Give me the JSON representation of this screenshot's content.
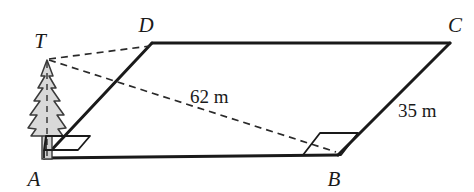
{
  "figure": {
    "type": "geometry-diagram",
    "colors": {
      "stroke": "#1a1a1a",
      "tree_fill": "#d9d9d9",
      "tree_outline": "#3a3a3a",
      "background": "#ffffff"
    },
    "vertices": [
      {
        "name": "A",
        "label": "A",
        "x": 44,
        "y": 158,
        "label_x": 34,
        "label_y": 186
      },
      {
        "name": "B",
        "label": "B",
        "x": 338,
        "y": 155,
        "label_x": 329,
        "label_y": 186
      },
      {
        "name": "C",
        "label": "C",
        "x": 450,
        "y": 43,
        "label_x": 449,
        "label_y": 30
      },
      {
        "name": "D",
        "label": "D",
        "x": 152,
        "y": 43,
        "label_x": 139,
        "label_y": 30
      },
      {
        "name": "T",
        "label": "T",
        "x": 47,
        "y": 58,
        "label_x": 35,
        "label_y": 48
      }
    ],
    "solid_edges": [
      {
        "name": "edge-A-B",
        "from": "A",
        "to": "B"
      },
      {
        "name": "edge-B-C",
        "from": "B",
        "to": "C"
      },
      {
        "name": "edge-C-D",
        "from": "C",
        "to": "D"
      },
      {
        "name": "edge-D-A",
        "from": "D",
        "to": "A"
      }
    ],
    "dashed_segments": [
      {
        "name": "segment-T-B",
        "from": "T",
        "to": "B"
      },
      {
        "name": "segment-T-D",
        "from": "T",
        "to": "D"
      },
      {
        "name": "tree-axis-T-A",
        "from": "T",
        "to": "A"
      }
    ],
    "measurements": [
      {
        "name": "label-62m",
        "text": "62 m",
        "x": 190,
        "y": 103,
        "applies_to": "segment-T-B"
      },
      {
        "name": "label-35m",
        "text": "35 m",
        "x": 398,
        "y": 117,
        "applies_to": "edge-B-C"
      }
    ],
    "right_angles": [
      {
        "name": "right-angle-at-A",
        "vertex": "A",
        "style": "parallelogram-marker"
      },
      {
        "name": "right-angle-at-B",
        "vertex": "B",
        "style": "parallelogram-marker"
      }
    ],
    "tree": {
      "name": "pine-tree",
      "base_x": 47,
      "base_y": 158,
      "apex_x": 47,
      "apex_y": 60
    }
  }
}
